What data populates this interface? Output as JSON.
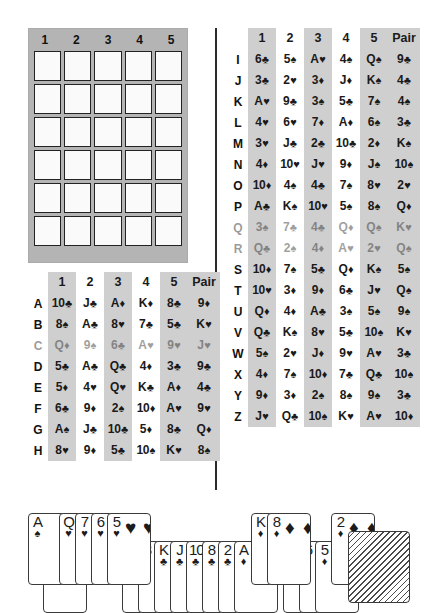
{
  "answer_grid": {
    "name": "blank-answer-grid",
    "columns": [
      "1",
      "2",
      "3",
      "4",
      "5"
    ],
    "rows": 6,
    "cell_value": ""
  },
  "left_table": {
    "headers": [
      "1",
      "2",
      "3",
      "4",
      "5",
      "Pair"
    ],
    "striped_columns": [
      0,
      2,
      4,
      5
    ],
    "rows": [
      {
        "label": "A",
        "cards": [
          "10♣",
          "J♣",
          "A♦",
          "K♦",
          "8♣",
          "9♦"
        ],
        "faded": false
      },
      {
        "label": "B",
        "cards": [
          "8♠",
          "A♣",
          "8♥",
          "7♣",
          "5♣",
          "K♥"
        ],
        "faded": false
      },
      {
        "label": "C",
        "cards": [
          "Q♦",
          "9♠",
          "6♣",
          "A♥",
          "9♥",
          "J♥"
        ],
        "faded": true
      },
      {
        "label": "D",
        "cards": [
          "5♣",
          "A♣",
          "Q♣",
          "4♦",
          "3♣",
          "9♣"
        ],
        "faded": false
      },
      {
        "label": "E",
        "cards": [
          "5♦",
          "4♥",
          "Q♥",
          "K♣",
          "A♦",
          "4♣"
        ],
        "faded": false
      },
      {
        "label": "F",
        "cards": [
          "6♣",
          "9♦",
          "2♠",
          "10♦",
          "A♥",
          "9♥"
        ],
        "faded": false
      },
      {
        "label": "G",
        "cards": [
          "A♠",
          "J♣",
          "10♣",
          "5♦",
          "8♣",
          "Q♦"
        ],
        "faded": false
      },
      {
        "label": "H",
        "cards": [
          "8♥",
          "9♦",
          "5♣",
          "10♠",
          "K♥",
          "8♠"
        ],
        "faded": false
      }
    ]
  },
  "right_table": {
    "headers": [
      "1",
      "2",
      "3",
      "4",
      "5",
      "Pair"
    ],
    "striped_columns": [
      0,
      2,
      4,
      5
    ],
    "rows": [
      {
        "label": "I",
        "cards": [
          "6♣",
          "5♠",
          "A♥",
          "4♠",
          "Q♠",
          "9♣"
        ],
        "faded": false
      },
      {
        "label": "J",
        "cards": [
          "3♣",
          "2♥",
          "3♦",
          "J♦",
          "K♠",
          "4♣"
        ],
        "faded": false
      },
      {
        "label": "K",
        "cards": [
          "A♥",
          "9♣",
          "3♠",
          "5♣",
          "7♠",
          "4♠"
        ],
        "faded": false
      },
      {
        "label": "L",
        "cards": [
          "4♥",
          "6♥",
          "7♦",
          "A♦",
          "6♠",
          "3♣"
        ],
        "faded": false
      },
      {
        "label": "M",
        "cards": [
          "3♥",
          "J♣",
          "2♣",
          "10♣",
          "2♦",
          "K♠"
        ],
        "faded": false
      },
      {
        "label": "N",
        "cards": [
          "4♦",
          "10♥",
          "J♥",
          "9♦",
          "J♠",
          "10♠"
        ],
        "faded": false
      },
      {
        "label": "O",
        "cards": [
          "10♦",
          "4♠",
          "4♣",
          "7♠",
          "8♥",
          "2♥"
        ],
        "faded": false
      },
      {
        "label": "P",
        "cards": [
          "A♣",
          "K♠",
          "10♥",
          "5♠",
          "8♠",
          "Q♦"
        ],
        "faded": false
      },
      {
        "label": "Q",
        "cards": [
          "3♠",
          "7♣",
          "4♣",
          "Q♦",
          "Q♠",
          "K♥"
        ],
        "faded": true
      },
      {
        "label": "R",
        "cards": [
          "Q♣",
          "2♠",
          "4♦",
          "A♥",
          "2♥",
          "Q♠"
        ],
        "faded": true
      },
      {
        "label": "S",
        "cards": [
          "10♦",
          "7♠",
          "5♣",
          "Q♦",
          "K♠",
          "5♠"
        ],
        "faded": false
      },
      {
        "label": "T",
        "cards": [
          "10♥",
          "3♦",
          "9♦",
          "6♣",
          "J♥",
          "Q♠"
        ],
        "faded": false
      },
      {
        "label": "U",
        "cards": [
          "Q♦",
          "4♦",
          "A♣",
          "3♠",
          "5♠",
          "9♠"
        ],
        "faded": false
      },
      {
        "label": "V",
        "cards": [
          "Q♣",
          "K♠",
          "8♥",
          "5♣",
          "10♠",
          "K♥"
        ],
        "faded": false
      },
      {
        "label": "W",
        "cards": [
          "5♠",
          "2♥",
          "J♦",
          "9♥",
          "A♥",
          "3♣"
        ],
        "faded": false
      },
      {
        "label": "X",
        "cards": [
          "4♦",
          "7♠",
          "10♦",
          "7♣",
          "Q♣",
          "10♠"
        ],
        "faded": false
      },
      {
        "label": "Y",
        "cards": [
          "9♦",
          "3♦",
          "2♠",
          "8♠",
          "9♠",
          "3♣"
        ],
        "faded": false
      },
      {
        "label": "Z",
        "cards": [
          "J♥",
          "Q♣",
          "10♠",
          "K♥",
          "A♥",
          "10♦"
        ],
        "faded": false
      }
    ]
  },
  "card_fan": {
    "name": "playing-card-fan",
    "cards": [
      {
        "rank": "A",
        "suit": "♠",
        "row": "top",
        "x": 28,
        "pip": false
      },
      {
        "rank": "6",
        "suit": "♠",
        "row": "bottom",
        "x": 43,
        "pip": false
      },
      {
        "rank": "Q",
        "suit": "♥",
        "row": "top",
        "x": 59,
        "pip": false
      },
      {
        "rank": "7",
        "suit": "♥",
        "row": "top",
        "x": 75,
        "pip": false
      },
      {
        "rank": "6",
        "suit": "♥",
        "row": "top",
        "x": 91,
        "pip": false
      },
      {
        "rank": "5",
        "suit": "♥",
        "row": "top",
        "x": 107,
        "pip": true
      },
      {
        "rank": "4",
        "suit": "♥",
        "row": "bottom",
        "x": 122,
        "pip": false
      },
      {
        "rank": "3",
        "suit": "♥",
        "row": "bottom",
        "x": 138,
        "pip": false
      },
      {
        "rank": "K",
        "suit": "♣",
        "row": "bottom",
        "x": 154,
        "pip": false
      },
      {
        "rank": "J",
        "suit": "♣",
        "row": "bottom",
        "x": 170,
        "pip": false
      },
      {
        "rank": "10",
        "suit": "♣",
        "row": "bottom",
        "x": 186,
        "pip": false
      },
      {
        "rank": "8",
        "suit": "♣",
        "row": "bottom",
        "x": 202,
        "pip": false
      },
      {
        "rank": "2",
        "suit": "♣",
        "row": "bottom",
        "x": 218,
        "pip": false
      },
      {
        "rank": "A",
        "suit": "♦",
        "row": "bottom",
        "x": 234,
        "pip": false
      },
      {
        "rank": "K",
        "suit": "♦",
        "row": "top",
        "x": 251,
        "pip": false
      },
      {
        "rank": "8",
        "suit": "♦",
        "row": "top",
        "x": 267,
        "pip": true
      },
      {
        "rank": "7",
        "suit": "♦",
        "row": "bottom",
        "x": 283,
        "pip": false
      },
      {
        "rank": "6",
        "suit": "♦",
        "row": "bottom",
        "x": 299,
        "pip": false
      },
      {
        "rank": "5",
        "suit": "♦",
        "row": "bottom",
        "x": 315,
        "pip": false
      },
      {
        "rank": "2",
        "suit": "♦",
        "row": "top",
        "x": 331,
        "pip": true
      }
    ],
    "facedown": {
      "label": "",
      "x": 348,
      "y": 28
    }
  },
  "colors": {
    "stripe": "#cfcfcf",
    "grid_background": "#b4b4b4",
    "cell": "#fafafa",
    "ink": "#1a1a1a"
  }
}
